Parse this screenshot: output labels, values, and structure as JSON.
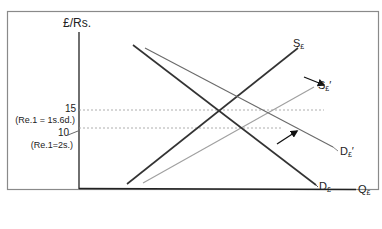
{
  "diagram": {
    "y_axis_label": "£/Rs.",
    "x_axis_label": "Q",
    "x_axis_sub": "£",
    "ticks": [
      {
        "value": "15",
        "note": "(Re.1 = 1s.6d.)"
      },
      {
        "value": "10",
        "note": "(Re.1=2s.)"
      }
    ],
    "curves": {
      "supply": {
        "letter": "S",
        "sub": "£",
        "prime": ""
      },
      "supply_shifted": {
        "letter": "S",
        "sub": "£",
        "prime": "′"
      },
      "demand": {
        "letter": "D",
        "sub": "£",
        "prime": ""
      },
      "demand_shifted": {
        "letter": "D",
        "sub": "£",
        "prime": "′"
      }
    },
    "colors": {
      "frame": "#8a8a8a",
      "axis": "#222222",
      "original_curve": "#333333",
      "shifted_supply": "#a0a0a0",
      "shifted_demand": "#6a6a6a",
      "guide": "#9a9a9a"
    },
    "arrows": [
      {
        "name": "supply-shift-arrow",
        "direction": "down-right"
      },
      {
        "name": "demand-shift-arrow",
        "direction": "up-right"
      }
    ]
  }
}
